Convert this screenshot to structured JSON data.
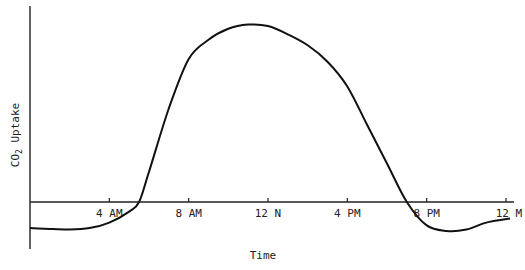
{
  "chart_data": {
    "type": "line",
    "title": "",
    "xlabel": "Time",
    "ylabel": "CO2 Uptake",
    "ylabel_main": "CO",
    "ylabel_sub": "2",
    "ylabel_rest": " Uptake",
    "x_ticks": [
      "4 AM",
      "8 AM",
      "12 N",
      "4 PM",
      "8 PM",
      "12 M"
    ],
    "x_tick_hours": [
      4,
      8,
      12,
      16,
      20,
      24
    ],
    "xlim_hours": [
      0,
      24
    ],
    "ylim": [
      -1,
      6.8
    ],
    "grid": false,
    "legend": null,
    "y_ticks": [],
    "series": [
      {
        "name": "CO2 uptake",
        "x_hours": [
          0,
          1,
          2,
          3,
          4,
          5,
          5.5,
          6,
          7,
          8,
          9,
          10,
          11,
          12,
          13,
          14,
          15,
          16,
          17,
          18,
          19,
          20,
          21,
          22,
          23,
          24.2
        ],
        "values": [
          -0.95,
          -0.98,
          -1.0,
          -0.95,
          -0.75,
          -0.35,
          0.0,
          1.1,
          3.4,
          5.2,
          5.9,
          6.3,
          6.45,
          6.4,
          6.1,
          5.7,
          5.1,
          4.2,
          2.8,
          1.4,
          0.0,
          -0.85,
          -1.05,
          -1.0,
          -0.75,
          -0.6
        ]
      }
    ]
  }
}
